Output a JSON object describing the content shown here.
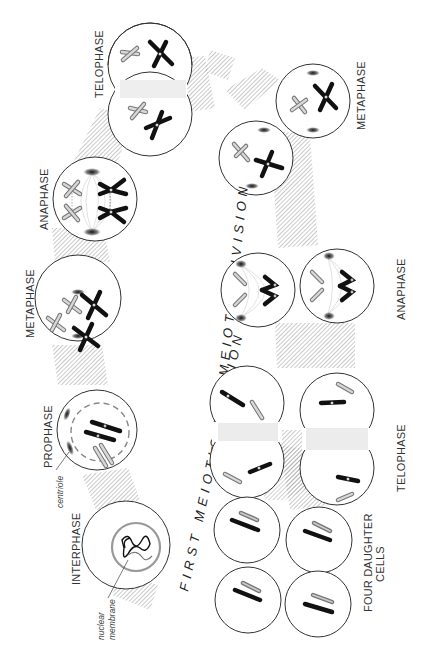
{
  "diagram": {
    "orientation": "rotated 90 degrees counter-clockwise",
    "colors": {
      "background": "#ffffff",
      "cell_outline": "#333333",
      "maternal_chromosome": "#111111",
      "paternal_chromosome": "#999999",
      "hatched_band": "#9a9a9a"
    },
    "divisions": {
      "first": "FIRST MEIOTIC DIVISION",
      "second": "SECOND MEIOTIC DIVISION"
    },
    "first_division_stages": [
      {
        "label": "INTERPHASE"
      },
      {
        "label": "PROPHASE"
      },
      {
        "label": "METAPHASE"
      },
      {
        "label": "ANAPHASE"
      },
      {
        "label": "TELOPHASE"
      }
    ],
    "second_division_stages": [
      {
        "label": "METAPHASE"
      },
      {
        "label": "ANAPHASE"
      },
      {
        "label": "TELOPHASE"
      }
    ],
    "final": {
      "line1": "FOUR DAUGHTER",
      "line2": "CELLS"
    },
    "annotations": {
      "centriole": "centriole",
      "nuclear_membrane_1": "nuclear",
      "nuclear_membrane_2": "membrane"
    }
  }
}
